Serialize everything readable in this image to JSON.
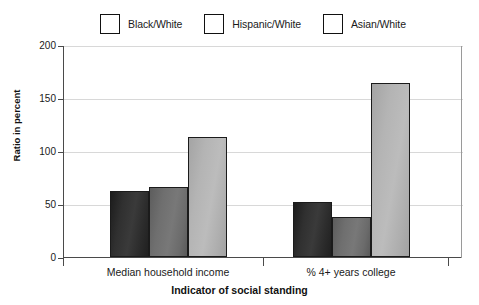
{
  "chart_data": {
    "type": "bar",
    "title": "",
    "subtitle": "",
    "xlabel": "Indicator of social standing",
    "ylabel": "Ratio in percent",
    "categories": [
      "Median household income",
      "% 4+ years college"
    ],
    "series": [
      {
        "name": "Black/White",
        "color": "#2a2a2a",
        "values": [
          62,
          52
        ]
      },
      {
        "name": "Hispanic/White",
        "color": "#6e6e6e",
        "values": [
          66,
          38
        ]
      },
      {
        "name": "Asian/White",
        "color": "#b0b0b0",
        "values": [
          113,
          164
        ]
      }
    ],
    "ylim": [
      0,
      200
    ],
    "yticks": [
      0,
      50,
      100,
      150,
      200
    ],
    "ytick_labels": [
      "0",
      "50",
      "100",
      "150",
      "200"
    ],
    "grid": true,
    "grid_axis": "y",
    "legend_position": "top"
  },
  "legend": {
    "items": [
      {
        "label": "Black/White",
        "swatch": "legend-swatch-black-white"
      },
      {
        "label": "Hispanic/White",
        "swatch": "legend-swatch-hispanic-white"
      },
      {
        "label": "Asian/White",
        "swatch": "legend-swatch-asian-white"
      }
    ]
  }
}
